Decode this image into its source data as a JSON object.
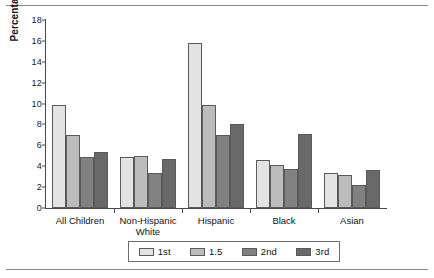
{
  "chart_data": {
    "type": "bar",
    "title": "",
    "xlabel": "",
    "ylabel": "Percentage",
    "ylim": [
      0,
      18
    ],
    "ytick_step": 2,
    "yticks": [
      "0",
      "2",
      "4",
      "6",
      "8",
      "10",
      "12",
      "14",
      "16",
      "18"
    ],
    "grid": false,
    "legend_position": "bottom",
    "categories": [
      "All Children",
      "Non-Hispanic\nWhite",
      "Hispanic",
      "Black",
      "Asian"
    ],
    "series": [
      {
        "name": "1st",
        "color": "#e3e3e3",
        "values": [
          9.9,
          4.85,
          15.8,
          4.55,
          3.35
        ]
      },
      {
        "name": "1.5",
        "color": "#bcbcbc",
        "values": [
          7.0,
          4.95,
          9.85,
          4.1,
          3.2
        ]
      },
      {
        "name": "2nd",
        "color": "#818181",
        "values": [
          4.9,
          3.35,
          7.0,
          3.75,
          2.2
        ]
      },
      {
        "name": "3rd",
        "color": "#696969",
        "values": [
          5.4,
          4.65,
          8.0,
          7.1,
          3.6
        ]
      }
    ]
  }
}
